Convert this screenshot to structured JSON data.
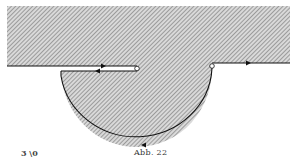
{
  "figure": {
    "caption": "Abb. 22",
    "margin_note": "3 \\0",
    "colors": {
      "hatch": "#8a8a8a",
      "background": "#ffffff",
      "line": "#111111"
    },
    "elements": {
      "upper_region": "hatched half-plane",
      "slit": "horizontal slit with two opposite arrows",
      "lower_region": "hatched semicircular region",
      "endpoints": [
        "slit-end-circle",
        "right-junction-circle"
      ],
      "arrows": [
        "slit-upper-arrow-right",
        "slit-lower-arrow-left",
        "right-edge-arrow-right",
        "arc-bottom-arrow"
      ]
    }
  }
}
